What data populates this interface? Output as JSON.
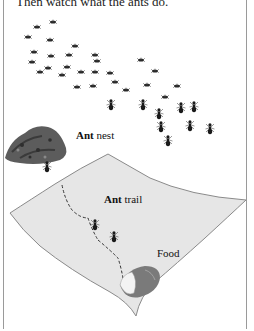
{
  "header": {
    "text": "Then watch what the ants do."
  },
  "labels": {
    "nest": {
      "bold": "Ant",
      "rest": " nest"
    },
    "trail": {
      "bold": "Ant",
      "rest": " trail"
    },
    "food": "Food"
  },
  "colors": {
    "paper": "#e9e9e9",
    "paper_edge": "#8a8a8a",
    "ant": "#1a1a1a",
    "nest": "#5a5a5a",
    "frame": "#9a9a9a"
  }
}
